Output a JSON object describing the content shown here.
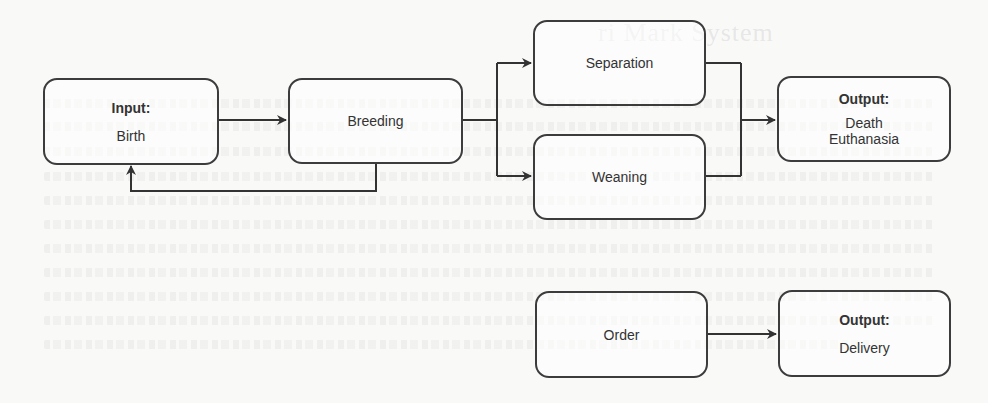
{
  "diagram": {
    "type": "flowchart",
    "nodes": {
      "birth": {
        "heading": "Input:",
        "lines": [
          "Birth"
        ]
      },
      "breeding": {
        "heading": "",
        "lines": [
          "Breeding"
        ]
      },
      "separation": {
        "heading": "",
        "lines": [
          "Separation"
        ]
      },
      "weaning": {
        "heading": "",
        "lines": [
          "Weaning"
        ]
      },
      "death": {
        "heading": "Output:",
        "lines": [
          "Death",
          "Euthanasia"
        ]
      },
      "order": {
        "heading": "",
        "lines": [
          "Order"
        ]
      },
      "delivery": {
        "heading": "Output:",
        "lines": [
          "Delivery"
        ]
      }
    },
    "edges": [
      {
        "from": "birth",
        "to": "breeding"
      },
      {
        "from": "breeding",
        "to": "birth",
        "kind": "feedback-loop"
      },
      {
        "from": "breeding",
        "to": "separation"
      },
      {
        "from": "breeding",
        "to": "weaning"
      },
      {
        "from": "separation",
        "to": "death"
      },
      {
        "from": "weaning",
        "to": "death"
      },
      {
        "from": "order",
        "to": "delivery"
      }
    ],
    "colors": {
      "stroke": "#3c3c3c",
      "text": "#333333",
      "background": "#f9f9f8"
    }
  },
  "background": {
    "bleed_through_title": "ri Mark System"
  }
}
